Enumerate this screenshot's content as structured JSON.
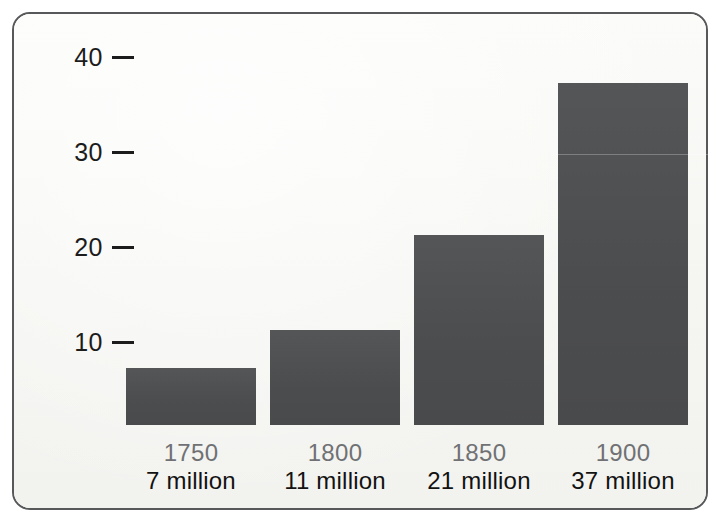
{
  "chart_data": {
    "type": "bar",
    "title": "",
    "subtitle": "",
    "xlabel": "",
    "ylabel": "",
    "categories": [
      "1750",
      "1800",
      "1850",
      "1900"
    ],
    "category_sublabels": [
      "7 million",
      "11 million",
      "21 million",
      "37 million"
    ],
    "values": [
      6,
      10,
      20,
      36
    ],
    "yticks": [
      "10",
      "20",
      "30",
      "40"
    ],
    "ytick_values": [
      10,
      20,
      30,
      40
    ],
    "ylim": [
      0,
      42
    ],
    "grid": false,
    "legend": null,
    "legend_position": "none",
    "colors": {
      "bar_fill": "#4d4e50",
      "frame_border": "#57585a",
      "panel_background": "#f7f7f5",
      "axis_text": "#1c1c1c",
      "year_label": "#6f7174",
      "population_label": "#121212"
    }
  },
  "axis": {
    "ticks": [
      {
        "label": "40",
        "mark": "—"
      },
      {
        "label": "30",
        "mark": "—"
      },
      {
        "label": "20",
        "mark": "—"
      },
      {
        "label": "10",
        "mark": "—"
      }
    ]
  },
  "bars": [
    {
      "year": "1750",
      "population": "7 million"
    },
    {
      "year": "1800",
      "population": "11 million"
    },
    {
      "year": "1850",
      "population": "21 million"
    },
    {
      "year": "1900",
      "population": "37 million"
    }
  ]
}
